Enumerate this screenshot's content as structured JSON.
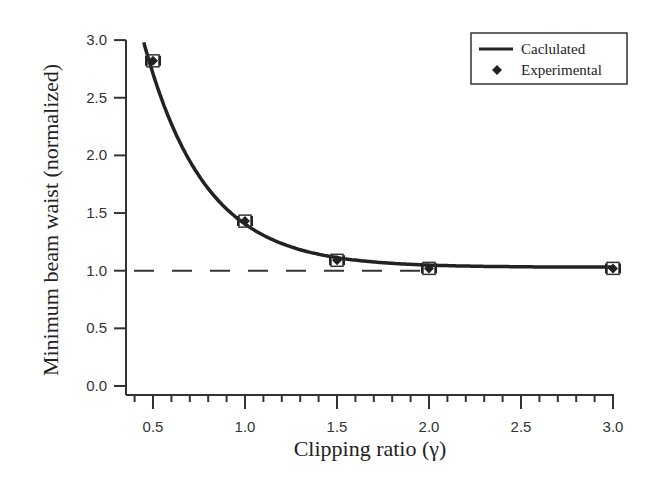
{
  "chart_data": {
    "type": "line",
    "title": "",
    "xlabel": "Clipping ratio (γ)",
    "ylabel": "Minimum beam waist (normalized)",
    "xlim": [
      0.4,
      3.0
    ],
    "ylim": [
      0.0,
      3.0
    ],
    "x_ticks": [
      "0.5",
      "1.0",
      "1.5",
      "2.0",
      "2.5",
      "3.0"
    ],
    "y_ticks": [
      "0.0",
      "0.5",
      "1.0",
      "1.5",
      "2.0",
      "2.5",
      "3.0"
    ],
    "grid": false,
    "legend_position": "upper right",
    "series": [
      {
        "name": "Caclulated",
        "style": "solid line",
        "x": [
          0.45,
          0.5,
          0.6,
          0.7,
          0.8,
          0.9,
          1.0,
          1.2,
          1.4,
          1.6,
          1.8,
          2.0,
          2.2,
          2.5,
          3.0
        ],
        "values": [
          3.0,
          2.75,
          2.32,
          1.98,
          1.73,
          1.55,
          1.42,
          1.24,
          1.14,
          1.08,
          1.05,
          1.04,
          1.03,
          1.03,
          1.03
        ]
      },
      {
        "name": "Experimental",
        "style": "diamond markers with error bars",
        "x": [
          0.5,
          1.0,
          1.5,
          2.0,
          3.0
        ],
        "values": [
          2.82,
          1.43,
          1.09,
          1.02,
          1.02
        ]
      }
    ],
    "reference_line": {
      "y": 1.0,
      "style": "dashed",
      "x_range": [
        0.4,
        2.0
      ]
    }
  },
  "legend": {
    "items": [
      {
        "label": "Caclulated",
        "symbol": "line"
      },
      {
        "label": "Experimental",
        "symbol": "diamond"
      }
    ]
  }
}
